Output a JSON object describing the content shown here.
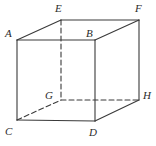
{
  "figure": {
    "name": "cube-diagram",
    "type": "geometric-solid",
    "shape": "cube",
    "background_color": "#ffffff",
    "line_color": "#3a3a3a",
    "label_color": "#2b2b2b",
    "stroke_width": 1.1,
    "dash_pattern": "5,3",
    "vertices": [
      {
        "id": "A",
        "label": "A",
        "x": 17,
        "y": 40,
        "label_x": 5,
        "label_y": 28,
        "hidden": false
      },
      {
        "id": "B",
        "label": "B",
        "x": 95,
        "y": 40,
        "label_x": 86,
        "label_y": 28,
        "hidden": false
      },
      {
        "id": "C",
        "label": "C",
        "x": 17,
        "y": 120,
        "label_x": 5,
        "label_y": 126,
        "hidden": false
      },
      {
        "id": "D",
        "label": "D",
        "x": 95,
        "y": 121,
        "label_x": 89,
        "label_y": 127,
        "hidden": false
      },
      {
        "id": "E",
        "label": "E",
        "x": 61,
        "y": 20,
        "label_x": 55,
        "label_y": 3,
        "hidden": false
      },
      {
        "id": "F",
        "label": "F",
        "x": 139,
        "y": 20,
        "label_x": 135,
        "label_y": 3,
        "hidden": false
      },
      {
        "id": "G",
        "label": "G",
        "x": 61,
        "y": 100,
        "label_x": 45,
        "label_y": 90,
        "hidden": true
      },
      {
        "id": "H",
        "label": "H",
        "x": 139,
        "y": 100,
        "label_x": 143,
        "label_y": 90,
        "hidden": false
      }
    ],
    "edges": [
      {
        "id": "AB",
        "from": "A",
        "to": "B",
        "style": "solid"
      },
      {
        "id": "AC",
        "from": "A",
        "to": "C",
        "style": "solid"
      },
      {
        "id": "AE",
        "from": "A",
        "to": "E",
        "style": "solid"
      },
      {
        "id": "BD",
        "from": "B",
        "to": "D",
        "style": "solid"
      },
      {
        "id": "BF",
        "from": "B",
        "to": "F",
        "style": "solid"
      },
      {
        "id": "CD",
        "from": "C",
        "to": "D",
        "style": "solid"
      },
      {
        "id": "DH",
        "from": "D",
        "to": "H",
        "style": "solid"
      },
      {
        "id": "EF",
        "from": "E",
        "to": "F",
        "style": "solid"
      },
      {
        "id": "FH",
        "from": "F",
        "to": "H",
        "style": "solid"
      },
      {
        "id": "EG",
        "from": "E",
        "to": "G",
        "style": "dashed"
      },
      {
        "id": "CG",
        "from": "C",
        "to": "G",
        "style": "dashed"
      },
      {
        "id": "GH",
        "from": "G",
        "to": "H",
        "style": "dashed"
      }
    ]
  }
}
